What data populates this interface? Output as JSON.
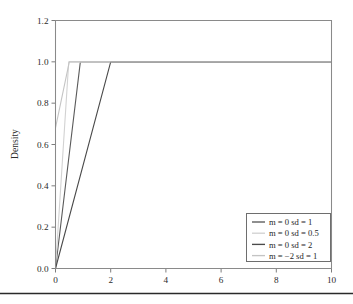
{
  "chart_data": {
    "type": "line",
    "title": "",
    "subtitle": "",
    "xlabel": "",
    "ylabel": "Density",
    "xlim": [
      0,
      10
    ],
    "ylim": [
      0.0,
      1.2
    ],
    "grid": false,
    "legend_position": "bottom-right",
    "x_ticks": [
      "0",
      "2",
      "4",
      "6",
      "8",
      "10"
    ],
    "x_tick_values": [
      0,
      2,
      4,
      6,
      8,
      10
    ],
    "y_ticks": [
      "0.0",
      "0.2",
      "0.4",
      "0.6",
      "0.8",
      "1.0",
      "1.2"
    ],
    "y_tick_values": [
      0.0,
      0.2,
      0.4,
      0.6,
      0.8,
      1.0,
      1.2
    ],
    "series": [
      {
        "name": "m = 0 sd = 1",
        "color": "#5a5a5a",
        "points": [
          [
            0.0,
            0.0
          ],
          [
            0.9,
            1.0
          ],
          [
            10.0,
            1.0
          ]
        ]
      },
      {
        "name": "m = 0 sd = 0.5",
        "color": "#d2d2d2",
        "points": [
          [
            0.0,
            0.0
          ],
          [
            0.48,
            1.0
          ],
          [
            10.0,
            1.0
          ]
        ]
      },
      {
        "name": "m = 0 sd = 2",
        "color": "#4a4a4a",
        "points": [
          [
            0.0,
            0.0
          ],
          [
            2.0,
            1.0
          ],
          [
            10.0,
            1.0
          ]
        ]
      },
      {
        "name": "m = -2 sd = 1",
        "color": "#c4c4c4",
        "points": [
          [
            0.0,
            0.68
          ],
          [
            0.5,
            1.0
          ],
          [
            10.0,
            1.0
          ]
        ]
      }
    ]
  },
  "legend": {
    "entries": [
      {
        "label": "m = 0 sd = 1"
      },
      {
        "label": "m = 0 sd = 0.5"
      },
      {
        "label": "m = 0 sd = 2"
      },
      {
        "label": "m = −2 sd = 1"
      }
    ]
  },
  "axes": {
    "y_title": "Density"
  }
}
